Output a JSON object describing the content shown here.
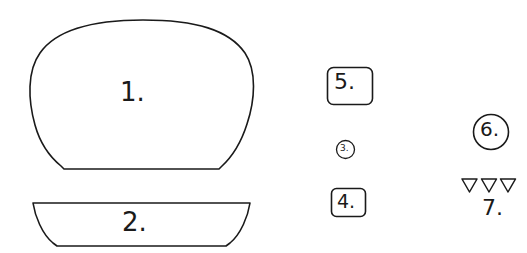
{
  "diagram": {
    "background_color": "#ffffff",
    "stroke_color": "#1a1a1a",
    "text_color": "#1a1a1a",
    "width": 527,
    "height": 253,
    "parts": [
      {
        "id": "part-1",
        "label": "1.",
        "shape": "dome",
        "description": "large rounded dome shape with flat bottom, top bun",
        "x": 32,
        "y": 20,
        "width": 222,
        "height": 155
      },
      {
        "id": "part-2",
        "label": "2.",
        "shape": "bowl",
        "description": "shallow bowl / inverted trapezoid with concave sides, bottom bun",
        "x": 33,
        "y": 202,
        "width": 217,
        "height": 45
      },
      {
        "id": "part-3",
        "label": "3.",
        "shape": "circle",
        "description": "small circle outline",
        "x": 336,
        "y": 140,
        "width": 19,
        "height": 19
      },
      {
        "id": "part-4",
        "label": "4.",
        "shape": "rounded-rectangle",
        "description": "small rounded square outline",
        "x": 331,
        "y": 188,
        "width": 35,
        "height": 29
      },
      {
        "id": "part-5",
        "label": "5.",
        "shape": "rounded-rectangle",
        "description": "rounded square outline, larger",
        "x": 327,
        "y": 67,
        "width": 46,
        "height": 38
      },
      {
        "id": "part-6",
        "label": "6.",
        "shape": "circle",
        "description": "medium circle outline",
        "x": 473,
        "y": 114,
        "width": 36,
        "height": 36
      },
      {
        "id": "part-7",
        "label": "7.",
        "shape": "triangle-row",
        "description": "three small downward-pointing triangle outlines",
        "count": 3,
        "x": 462,
        "y": 178,
        "width": 53,
        "height": 14
      }
    ]
  }
}
